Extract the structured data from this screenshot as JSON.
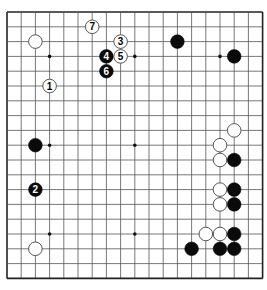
{
  "board": {
    "size": 19,
    "origin_x": 7,
    "origin_y": 12,
    "spacing_x": 14.2,
    "spacing_y": 14.8,
    "line_color": "#555555",
    "border_color": "#222222",
    "background": "#ffffff",
    "stone_radius": 6.8
  },
  "hoshi": [
    {
      "c": 3,
      "r": 3
    },
    {
      "c": 9,
      "r": 3
    },
    {
      "c": 15,
      "r": 3
    },
    {
      "c": 3,
      "r": 9
    },
    {
      "c": 9,
      "r": 9
    },
    {
      "c": 15,
      "r": 9
    },
    {
      "c": 3,
      "r": 15
    },
    {
      "c": 9,
      "r": 15
    },
    {
      "c": 15,
      "r": 15
    }
  ],
  "stones": [
    {
      "color": "white",
      "c": 2,
      "r": 2
    },
    {
      "color": "black",
      "c": 12,
      "r": 2
    },
    {
      "color": "black",
      "c": 16,
      "r": 3
    },
    {
      "color": "black",
      "c": 2,
      "r": 9
    },
    {
      "color": "white",
      "c": 2,
      "r": 16
    },
    {
      "color": "white",
      "c": 16,
      "r": 8
    },
    {
      "color": "white",
      "c": 15,
      "r": 9
    },
    {
      "color": "white",
      "c": 15,
      "r": 10
    },
    {
      "color": "black",
      "c": 16,
      "r": 10
    },
    {
      "color": "white",
      "c": 15,
      "r": 12
    },
    {
      "color": "black",
      "c": 16,
      "r": 12
    },
    {
      "color": "white",
      "c": 15,
      "r": 13
    },
    {
      "color": "black",
      "c": 16,
      "r": 13
    },
    {
      "color": "white",
      "c": 14,
      "r": 15
    },
    {
      "color": "white",
      "c": 15,
      "r": 15
    },
    {
      "color": "black",
      "c": 16,
      "r": 15
    },
    {
      "color": "black",
      "c": 13,
      "r": 16
    },
    {
      "color": "black",
      "c": 15,
      "r": 16
    },
    {
      "color": "black",
      "c": 16,
      "r": 16
    }
  ],
  "moves": [
    {
      "number": "1",
      "color": "white",
      "c": 3,
      "r": 5
    },
    {
      "number": "2",
      "color": "black",
      "c": 2,
      "r": 12
    },
    {
      "number": "3",
      "color": "white",
      "c": 8,
      "r": 2
    },
    {
      "number": "4",
      "color": "black",
      "c": 7,
      "r": 3
    },
    {
      "number": "5",
      "color": "white",
      "c": 8,
      "r": 3
    },
    {
      "number": "6",
      "color": "black",
      "c": 7,
      "r": 4
    },
    {
      "number": "7",
      "color": "white",
      "c": 6,
      "r": 1
    }
  ]
}
